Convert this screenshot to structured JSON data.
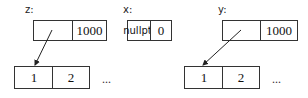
{
  "variables": [
    {
      "name": "z:",
      "ptr": "",
      "size": "1000"
    },
    {
      "name": "x:",
      "ptr": "nullptr",
      "size": "0"
    },
    {
      "name": "y:",
      "ptr": "",
      "size": "1000"
    }
  ],
  "arrays": [
    {
      "cells": [
        "1",
        "2"
      ],
      "ellipsis": "..."
    },
    {
      "cells": [
        "1",
        "2"
      ],
      "ellipsis": "..."
    }
  ]
}
